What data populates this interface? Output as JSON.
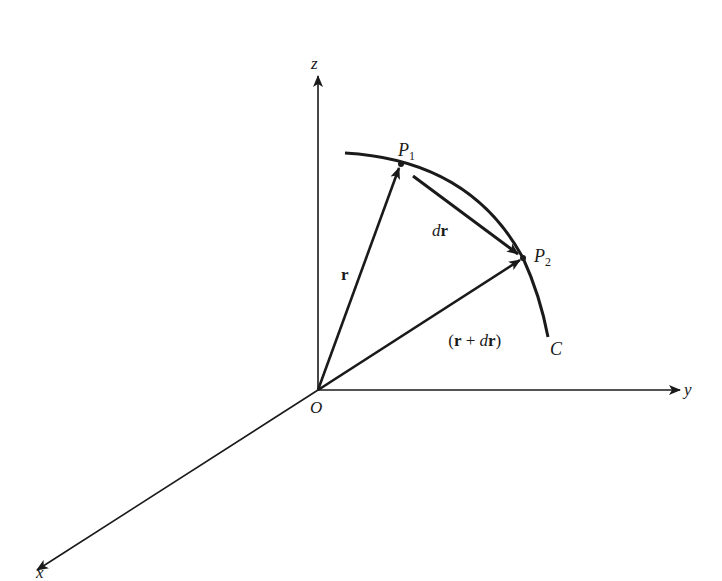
{
  "figure": {
    "colors": {
      "ink": "#1a1a1a",
      "background": "#ffffff"
    },
    "axes": {
      "z_label": "z",
      "y_label": "y",
      "x_label": "x",
      "origin_label": "O"
    },
    "points": {
      "p1": {
        "label": "P",
        "subscript": "1"
      },
      "p2": {
        "label": "P",
        "subscript": "2"
      }
    },
    "curve": {
      "label": "C"
    },
    "vectors": {
      "r": {
        "label": "r"
      },
      "dr": {
        "label_italic": "d",
        "label_bold": "r"
      },
      "r_plus_dr": {
        "open": "(",
        "r": "r",
        "plus": " + ",
        "d": "d",
        "r2": "r",
        "close": ")"
      }
    }
  }
}
